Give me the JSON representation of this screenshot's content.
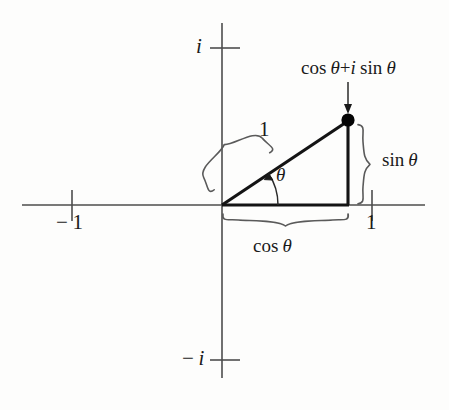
{
  "figure": {
    "name": "complex-unit-circle-point",
    "background_color": "#fdfdfc",
    "ink_color": "#1a1a1a"
  },
  "axes": {
    "real_axis": {
      "name": "real-axis",
      "y": 205,
      "x_start": 22,
      "x_end": 425
    },
    "imaginary_axis": {
      "name": "imaginary-axis",
      "x": 222,
      "y_start": 23,
      "y_end": 378
    },
    "ticks": [
      {
        "id": "tick-imag-pos",
        "label": "i",
        "italic": true,
        "axis": "imaginary",
        "x": 222,
        "y": 48
      },
      {
        "id": "tick-imag-neg",
        "label": "-i",
        "italic": true,
        "axis": "imaginary",
        "x": 222,
        "y": 360
      },
      {
        "id": "tick-real-neg",
        "label": "-1",
        "italic": false,
        "axis": "real",
        "x": 72,
        "y": 205
      },
      {
        "id": "tick-real-pos",
        "label": "1",
        "italic": false,
        "axis": "real",
        "x": 372,
        "y": 205
      }
    ],
    "tick_labels": {
      "imag_pos": "i",
      "imag_neg_sign": "−",
      "imag_neg": "i",
      "real_neg_sign": "−",
      "real_neg": "1",
      "real_pos": "1"
    }
  },
  "geometry": {
    "origin": {
      "x": 222,
      "y": 205
    },
    "point": {
      "x": 348,
      "y": 120,
      "label": "point-marker",
      "radius": 6.5
    },
    "triangle": {
      "adjacent_leg": {
        "from_x": 222,
        "from_y": 205,
        "to_x": 348,
        "to_y": 205
      },
      "opposite_leg": {
        "from_x": 348,
        "from_y": 205,
        "to_x": 348,
        "to_y": 120
      },
      "hypotenuse": {
        "from_x": 222,
        "from_y": 205,
        "to_x": 348,
        "to_y": 120
      }
    },
    "angle_arc": {
      "center_x": 222,
      "center_y": 205,
      "radius": 56,
      "from_deg": 0,
      "to_deg": 34
    }
  },
  "annotations": {
    "point_label": {
      "cos": "cos",
      "theta": "θ",
      "plus": "+",
      "i": "i",
      "sin": "sin",
      "theta2": "θ",
      "full_text": "cos θ + i sin θ",
      "arrow_from": {
        "x": 348,
        "y": 82
      },
      "arrow_to": {
        "x": 348,
        "y": 112
      }
    },
    "sin_label": {
      "fn": "sin",
      "theta": "θ",
      "full_text": "sin θ",
      "brace": {
        "orientation": "right",
        "x": 362,
        "y_top": 120,
        "y_bottom": 205
      }
    },
    "cos_label": {
      "fn": "cos",
      "theta": "θ",
      "full_text": "cos θ",
      "brace": {
        "orientation": "bottom",
        "y": 218,
        "x_left": 222,
        "x_right": 348
      }
    },
    "hypotenuse_label": {
      "text": "1",
      "brace": {
        "orientation": "rotated",
        "angle_deg": -34,
        "length": 152
      }
    },
    "angle_label": {
      "text": "θ"
    }
  },
  "colors": {
    "axis": "#555555",
    "triangle": "#141414",
    "brace": "#5a5a5a",
    "point": "#050505"
  }
}
